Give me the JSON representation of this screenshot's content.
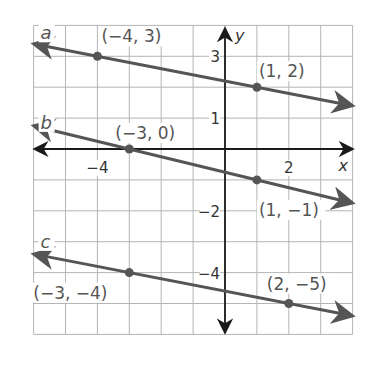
{
  "chart_data": {
    "type": "line",
    "title": "",
    "xlabel": "x",
    "ylabel": "y",
    "xlim": [
      -6,
      4
    ],
    "ylim": [
      -6,
      4
    ],
    "grid": true,
    "x_tick_labels": [
      {
        "value": -4,
        "label": "−4"
      },
      {
        "value": 2,
        "label": "2"
      }
    ],
    "y_tick_labels": [
      {
        "value": 3,
        "label": "3"
      },
      {
        "value": 1,
        "label": "1"
      },
      {
        "value": -2,
        "label": "−2"
      },
      {
        "value": -4,
        "label": "−4"
      }
    ],
    "series": [
      {
        "name": "a",
        "points": [
          [
            -4,
            3
          ],
          [
            1,
            2
          ]
        ],
        "point_labels": [
          "(−4, 3)",
          "(1, 2)"
        ],
        "slope": -0.2
      },
      {
        "name": "b",
        "points": [
          [
            -3,
            0
          ],
          [
            1,
            -1
          ]
        ],
        "point_labels": [
          "(−3, 0)",
          "(1, −1)"
        ],
        "slope": -0.25
      },
      {
        "name": "c",
        "points": [
          [
            -3,
            -4
          ],
          [
            2,
            -5
          ]
        ],
        "point_labels": [
          "(−3, −4)",
          "(2, −5)"
        ],
        "slope": -0.2
      }
    ],
    "colors": {
      "grid": "#b5b5b5",
      "axis": "#1a1a1a",
      "line": "#555555"
    }
  }
}
